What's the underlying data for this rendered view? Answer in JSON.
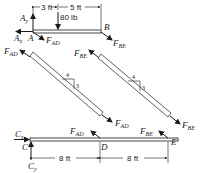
{
  "beam_ab": {
    "support_label": "A",
    "end_label": "B",
    "reaction_x": "A",
    "reaction_x_sub": "x",
    "reaction_y": "A",
    "reaction_y_sub": "y",
    "load": "80 lb",
    "dim_left": "3 ft",
    "dim_right": "5 ft",
    "force_ad": "F",
    "force_ad_sub": "AD",
    "force_be": "F",
    "force_be_sub": "BE"
  },
  "member_ad": {
    "force": "F",
    "force_sub": "AD",
    "slope_run": "4",
    "slope_rise": "3"
  },
  "member_be": {
    "force": "F",
    "force_sub": "BE",
    "slope_run": "4",
    "slope_rise": "3"
  },
  "beam_ce": {
    "support_label": "C",
    "mid_label": "D",
    "end_label": "E",
    "reaction_x": "C",
    "reaction_x_sub": "x",
    "reaction_y": "C",
    "reaction_y_sub": "y",
    "force_ad": "F",
    "force_ad_sub": "AD",
    "force_be": "F",
    "force_be_sub": "BE",
    "dim_left": "8 ft",
    "dim_right": "8 ft"
  }
}
